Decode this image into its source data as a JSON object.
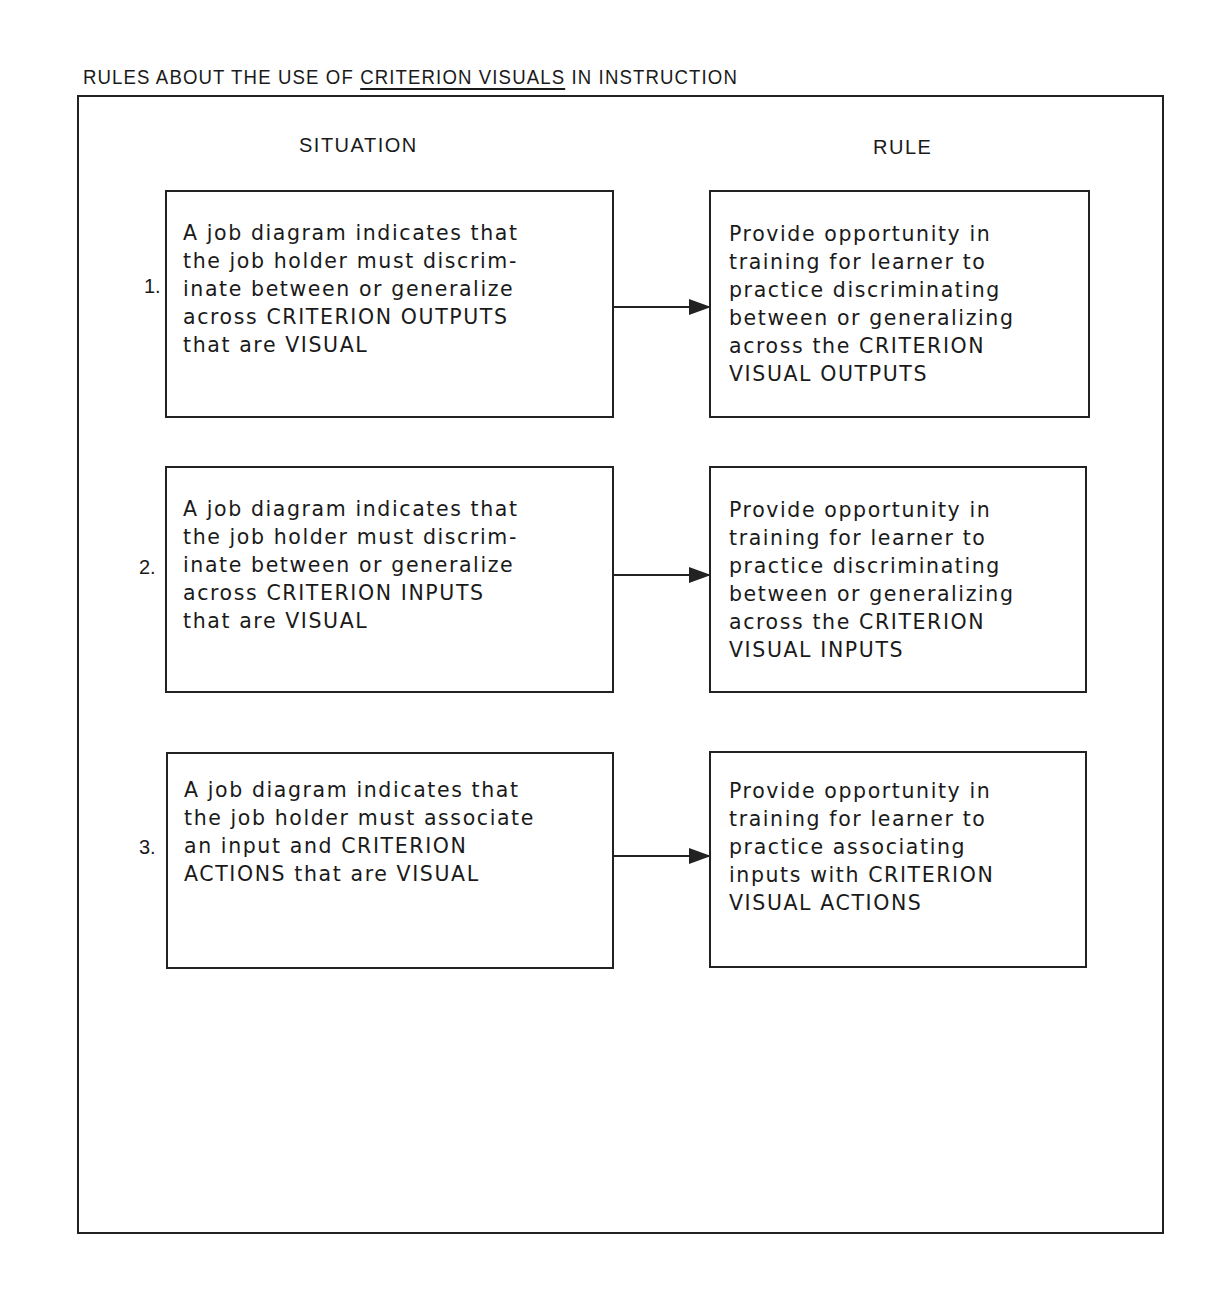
{
  "title": {
    "prefix": "RULES ABOUT THE USE OF ",
    "underlined": "CRITERION VISUALS",
    "suffix": " IN INSTRUCTION"
  },
  "columns": {
    "situation": "SITUATION",
    "rule": "RULE"
  },
  "rows": [
    {
      "number": "1.",
      "situation": "A job diagram indicates that\nthe job holder must discrim-\ninate between or generalize\nacross CRITERION OUTPUTS\nthat are VISUAL",
      "rule": "Provide opportunity in\ntraining for learner to\npractice discriminating\nbetween or generalizing\nacross the CRITERION\nVISUAL OUTPUTS"
    },
    {
      "number": "2.",
      "situation": "A job diagram indicates that\nthe job holder must discrim-\ninate between or generalize\nacross CRITERION INPUTS\nthat are VISUAL",
      "rule": "Provide opportunity in\ntraining for learner to\npractice discriminating\nbetween or generalizing\nacross the CRITERION\nVISUAL INPUTS"
    },
    {
      "number": "3.",
      "situation": "A job diagram indicates that\nthe job holder must associate\nan input and CRITERION\nACTIONS that are VISUAL",
      "rule": "Provide opportunity in\ntraining for learner to\npractice associating\ninputs with CRITERION\nVISUAL ACTIONS"
    }
  ]
}
